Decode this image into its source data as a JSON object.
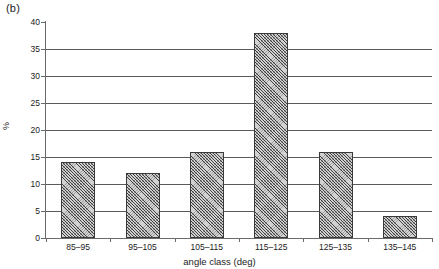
{
  "panel": {
    "label": "(b)"
  },
  "chart_data": {
    "type": "bar",
    "title": "",
    "subtitle": "",
    "panel_label": "(b)",
    "categories": [
      "85–95",
      "95–105",
      "105–115",
      "115–125",
      "125–135",
      "135–145"
    ],
    "values": [
      14,
      12,
      16,
      38,
      16,
      4
    ],
    "xlabel": "angle class (deg)",
    "ylabel": "%",
    "ylim": [
      0,
      40
    ],
    "yticks": [
      0,
      5,
      10,
      15,
      20,
      25,
      30,
      35,
      40
    ],
    "ytick_labels": [
      "0",
      "5",
      "10",
      "15",
      "20",
      "25",
      "30",
      "35",
      "40"
    ],
    "grid": "horizontal",
    "legend": "none",
    "bar_fill": "diagonal-crosshatch",
    "bar_edge_color": "#3a3a3a",
    "gridline_color": "#5a5a5a",
    "axis_color": "#6a6a6a"
  }
}
